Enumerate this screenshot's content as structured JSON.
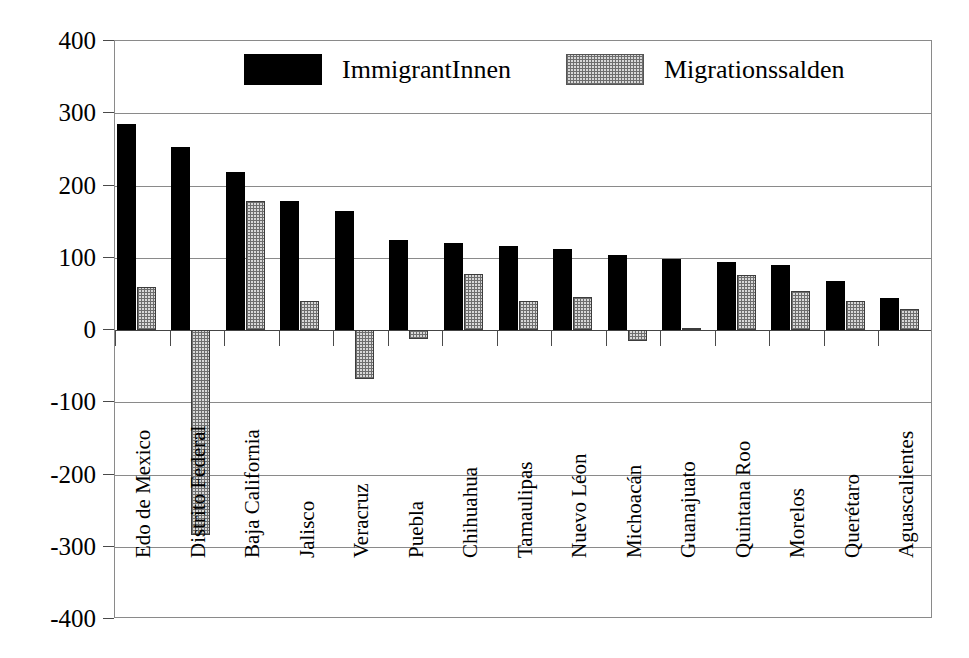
{
  "chart_data": {
    "type": "bar",
    "title": "",
    "subtitle": "",
    "xlabel": "",
    "ylabel": "",
    "ylim": [
      -400,
      400
    ],
    "ytick_labels": [
      "400",
      "300",
      "200",
      "100",
      "0",
      "-100",
      "-200",
      "-300",
      "-400"
    ],
    "yticks": [
      400,
      300,
      200,
      100,
      0,
      -100,
      -200,
      -300,
      -400
    ],
    "grid": true,
    "legend_position": "top-center",
    "categories": [
      "Edo de Mexico",
      "Distrito Federal",
      "Baja California",
      "Jalisco",
      "Veracruz",
      "Puebla",
      "Chihuahua",
      "Tamaulipas",
      "Nuevo Léon",
      "Michoacán",
      "Guanajuato",
      "Quintana Roo",
      "Morelos",
      "Querétaro",
      "Aguascalientes"
    ],
    "series": [
      {
        "name": "ImmigrantInnen",
        "color": "#000000",
        "values": [
          285,
          253,
          219,
          178,
          165,
          125,
          120,
          116,
          112,
          104,
          98,
          94,
          90,
          68,
          44
        ]
      },
      {
        "name": "Migrationssalden",
        "color": "#d8d8d8",
        "values": [
          60,
          -283,
          179,
          40,
          -68,
          -12,
          78,
          40,
          46,
          -15,
          3,
          76,
          54,
          40,
          29
        ]
      }
    ]
  },
  "legend": {
    "items": [
      {
        "label": "ImmigrantInnen",
        "swatch": "black-filled-swatch"
      },
      {
        "label": "Migrationssalden",
        "swatch": "gray-dotted-swatch"
      }
    ]
  }
}
